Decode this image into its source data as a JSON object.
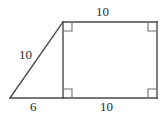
{
  "figure": {
    "type": "composite-geometry-diagram",
    "background_color": "#ffffff",
    "stroke_color": "#4a4a4a",
    "stroke_width": 1.4,
    "label_color": "#2b2b2b",
    "canvas": {
      "width": 168,
      "height": 118
    },
    "vertices": {
      "triangle_apex_left": {
        "x": 10,
        "y": 98
      },
      "shared_top": {
        "x": 63,
        "y": 22
      },
      "shared_bottom": {
        "x": 63,
        "y": 98
      },
      "rect_top_right": {
        "x": 157,
        "y": 22
      },
      "rect_bottom_right": {
        "x": 157,
        "y": 98
      }
    },
    "right_angle_markers": [
      {
        "name": "rect-top-left-right-angle",
        "x": 63,
        "y": 22,
        "size": 9,
        "dir_x": 1,
        "dir_y": 1
      },
      {
        "name": "rect-top-right-right-angle",
        "x": 157,
        "y": 22,
        "size": 9,
        "dir_x": -1,
        "dir_y": 1
      },
      {
        "name": "rect-bottom-left-right-angle",
        "x": 63,
        "y": 98,
        "size": 9,
        "dir_x": 1,
        "dir_y": -1
      },
      {
        "name": "rect-bottom-right-right-angle",
        "x": 157,
        "y": 98,
        "size": 9,
        "dir_x": -1,
        "dir_y": -1
      }
    ],
    "labels": {
      "top": "10",
      "left_hypotenuse": "10",
      "bottom_left_base": "6",
      "bottom_right_base": "10"
    }
  },
  "chart_data": {
    "type": "diagram",
    "title": "",
    "shapes": [
      {
        "name": "right-triangle",
        "kind": "triangle",
        "points": [
          [
            10,
            98
          ],
          [
            63,
            22
          ],
          [
            63,
            98
          ]
        ],
        "side_labels": {
          "hypotenuse": "10",
          "base": "6",
          "height": ""
        }
      },
      {
        "name": "rectangle",
        "kind": "rectangle",
        "points": [
          [
            63,
            22
          ],
          [
            157,
            22
          ],
          [
            157,
            98
          ],
          [
            63,
            98
          ]
        ],
        "side_labels": {
          "top": "10",
          "bottom": "10",
          "left": "",
          "right": ""
        }
      }
    ],
    "measures": [
      {
        "label": "10",
        "edge": "rectangle-top"
      },
      {
        "label": "10",
        "edge": "triangle-hypotenuse"
      },
      {
        "label": "6",
        "edge": "triangle-base"
      },
      {
        "label": "10",
        "edge": "rectangle-bottom"
      }
    ]
  }
}
